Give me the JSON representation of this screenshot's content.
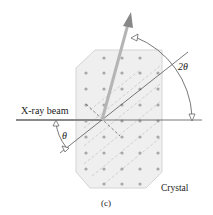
{
  "labels": {
    "beam": "X-ray beam",
    "theta": "θ",
    "two_theta": "2θ",
    "crystal": "Crystal",
    "caption": "(c)"
  },
  "colors": {
    "crystal_fill": "#efefef",
    "crystal_stroke": "#d4d4d4",
    "atom": "#a8a8a8",
    "line": "#555555",
    "beam": "#8a8a8a",
    "reflected_beam": "#b5b5b5",
    "plane_dash": "#c8c8c8"
  },
  "diagram": {
    "origin": [
      102,
      120
    ],
    "atom_columns_x": [
      86,
      104,
      122,
      140,
      158
    ],
    "atom_rows_y": [
      58,
      73,
      89,
      105,
      121,
      137,
      153,
      169,
      184
    ]
  }
}
